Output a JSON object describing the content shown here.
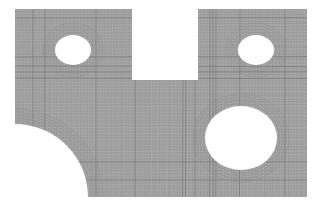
{
  "figure": {
    "mesh_type": "quadrilateral",
    "colors": {
      "background": "#ffffff",
      "plate_fill": "#a9a9a9",
      "mesh_line": "#8a8a8a",
      "mesh_line_dark": "#6e6e6e",
      "hole_fill": "#ffffff"
    },
    "features": [
      {
        "name": "plate-outline",
        "kind": "rectangle"
      },
      {
        "name": "top-notch",
        "kind": "rectangular cutout"
      },
      {
        "name": "small-hole-left",
        "kind": "circular hole"
      },
      {
        "name": "small-hole-right",
        "kind": "circular hole"
      },
      {
        "name": "large-hole",
        "kind": "circular hole"
      },
      {
        "name": "corner-cutout",
        "kind": "quarter-circle cutout"
      }
    ]
  }
}
